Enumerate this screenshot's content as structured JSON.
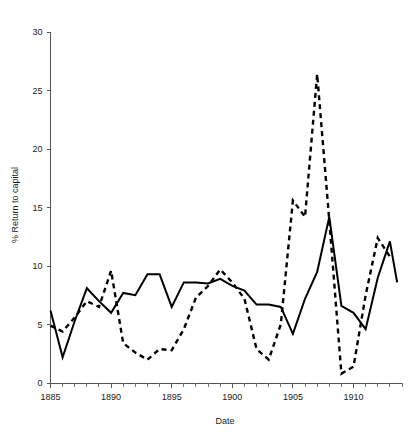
{
  "chart_data": {
    "type": "line",
    "title": "",
    "xlabel": "Date",
    "ylabel": "% Return to capital",
    "xlim": [
      1885,
      1914
    ],
    "ylim": [
      0,
      30
    ],
    "yticks": [
      0,
      5,
      10,
      15,
      20,
      25,
      30
    ],
    "ytick_labels": [
      "0",
      "5",
      "10",
      "15",
      "20",
      "25",
      "30"
    ],
    "xticks": [
      1885,
      1890,
      1895,
      1900,
      1905,
      1910
    ],
    "xtick_labels": [
      "1885",
      "1890",
      "1895",
      "1900",
      "1905",
      "1910"
    ],
    "xtick_minor_step": 1,
    "grid": false,
    "legend": "none",
    "x": [
      1885,
      1886,
      1887,
      1888,
      1889,
      1890,
      1891,
      1892,
      1893,
      1894,
      1895,
      1896,
      1897,
      1898,
      1899,
      1900,
      1901,
      1902,
      1903,
      1904,
      1905,
      1906,
      1907,
      1908,
      1909,
      1910,
      1911,
      1912,
      1913
    ],
    "series": [
      {
        "name": "solid-series",
        "style": "solid",
        "color": "#000000",
        "values": [
          6.2,
          2.2,
          5.3,
          8.1,
          7.0,
          6.0,
          7.7,
          7.5,
          9.3,
          9.3,
          6.5,
          8.6,
          8.6,
          8.5,
          8.9,
          8.3,
          7.9,
          6.7,
          6.7,
          6.5,
          4.2,
          7.2,
          9.5,
          14.2,
          6.6,
          6.0,
          4.6,
          9.0,
          12.1
        ]
      },
      {
        "name": "dashed-series",
        "style": "dashed",
        "color": "#000000",
        "values": [
          4.9,
          4.4,
          5.6,
          7.0,
          6.5,
          9.6,
          3.4,
          2.6,
          2.0,
          2.9,
          2.8,
          4.6,
          7.3,
          8.3,
          9.7,
          8.6,
          7.2,
          2.9,
          2.0,
          5.0,
          15.6,
          14.2,
          26.4,
          13.9,
          0.8,
          1.4,
          7.5,
          12.4,
          10.8
        ]
      }
    ],
    "series_tail": {
      "solid_final_x": 1913.6,
      "solid_final_y": 8.6
    },
    "annotations": []
  }
}
